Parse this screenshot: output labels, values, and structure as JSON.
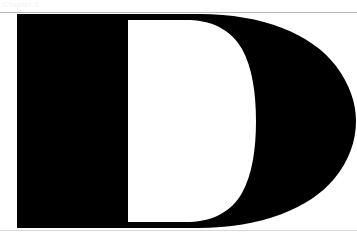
{
  "page": {
    "width": 357,
    "height": 240,
    "background_color": "#ffffff",
    "ink_color": "#000000"
  },
  "header": {
    "text": "Chapter 1",
    "color": "#f2f2f2"
  },
  "rules": {
    "top": {
      "name": "top-rule",
      "color": "#b8b8b8",
      "y": 12
    },
    "bottom": {
      "name": "bottom-rule",
      "color": "#d8d8d8",
      "y": 230
    }
  },
  "glyph": {
    "character": "D",
    "style": "serif-capital-dropcap",
    "color": "#000000",
    "stem": {
      "left": 17,
      "right": 128,
      "top": 14,
      "bottom": 228
    },
    "bowl": {
      "right_extent": 348,
      "vertical_center": 121
    },
    "counter": {
      "left": 128,
      "right": 235,
      "top": 20,
      "bottom": 222
    }
  }
}
